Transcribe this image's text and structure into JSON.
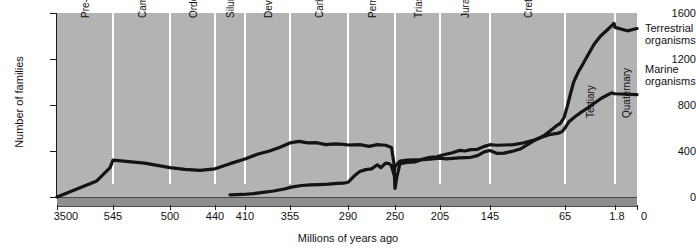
{
  "chart_data": {
    "type": "line",
    "title": "",
    "xlabel": "Millions of years ago",
    "ylabel": "Number of families",
    "ylim": [
      0,
      1600
    ],
    "yticks": [
      0,
      400,
      800,
      1200,
      1600
    ],
    "ytick_labels": [
      "0",
      "400",
      "800",
      "1200",
      "1600"
    ],
    "xtick_labels": [
      "3500",
      "545",
      "500",
      "440",
      "410",
      "355",
      "290",
      "250",
      "205",
      "145",
      "65",
      "1.8",
      "0"
    ],
    "xtick_values": [
      3500,
      545,
      500,
      440,
      410,
      355,
      290,
      250,
      205,
      145,
      65,
      1.8,
      0
    ],
    "x_axis_reversed": true,
    "grid": false,
    "legend_position": "right",
    "periods": [
      "Pre-cambrian",
      "Cambrian",
      "Ordovician",
      "Silurian",
      "Devonian",
      "Carboniferous",
      "Permian",
      "Triassic",
      "Jurassic",
      "Cretaceous",
      "Tertiary",
      "Quaternary"
    ],
    "series": [
      {
        "name": "Marine organisms",
        "legend_label_line1": "Marine",
        "legend_label_line2": "organisms",
        "color": "#141414",
        "points": [
          [
            3500,
            0
          ],
          [
            1400,
            140
          ],
          [
            700,
            255
          ],
          [
            545,
            320
          ],
          [
            520,
            295
          ],
          [
            500,
            255
          ],
          [
            480,
            240
          ],
          [
            460,
            232
          ],
          [
            440,
            245
          ],
          [
            425,
            290
          ],
          [
            410,
            330
          ],
          [
            395,
            372
          ],
          [
            380,
            400
          ],
          [
            368,
            430
          ],
          [
            355,
            470
          ],
          [
            345,
            483
          ],
          [
            335,
            470
          ],
          [
            325,
            472
          ],
          [
            315,
            455
          ],
          [
            305,
            462
          ],
          [
            295,
            458
          ],
          [
            290,
            452
          ],
          [
            280,
            455
          ],
          [
            272,
            440
          ],
          [
            265,
            455
          ],
          [
            258,
            450
          ],
          [
            253,
            430
          ],
          [
            251,
            300
          ],
          [
            250,
            75
          ],
          [
            248,
            180
          ],
          [
            245,
            290
          ],
          [
            238,
            300
          ],
          [
            230,
            305
          ],
          [
            222,
            330
          ],
          [
            215,
            345
          ],
          [
            208,
            350
          ],
          [
            205,
            358
          ],
          [
            198,
            372
          ],
          [
            190,
            385
          ],
          [
            182,
            405
          ],
          [
            175,
            400
          ],
          [
            168,
            412
          ],
          [
            160,
            415
          ],
          [
            152,
            440
          ],
          [
            145,
            455
          ],
          [
            138,
            450
          ],
          [
            130,
            452
          ],
          [
            120,
            455
          ],
          [
            110,
            470
          ],
          [
            100,
            490
          ],
          [
            90,
            520
          ],
          [
            80,
            545
          ],
          [
            72,
            555
          ],
          [
            68,
            570
          ],
          [
            65,
            600
          ],
          [
            60,
            655
          ],
          [
            52,
            700
          ],
          [
            44,
            740
          ],
          [
            36,
            775
          ],
          [
            28,
            815
          ],
          [
            20,
            855
          ],
          [
            12,
            885
          ],
          [
            6,
            905
          ],
          [
            2,
            898
          ],
          [
            0,
            890
          ]
        ]
      },
      {
        "name": "Terrestrial organisms",
        "legend_label_line1": "Terrestrial",
        "legend_label_line2": "organisms",
        "color": "#141414",
        "points": [
          [
            425,
            18
          ],
          [
            412,
            22
          ],
          [
            400,
            30
          ],
          [
            388,
            40
          ],
          [
            375,
            52
          ],
          [
            362,
            70
          ],
          [
            352,
            88
          ],
          [
            342,
            100
          ],
          [
            332,
            105
          ],
          [
            322,
            108
          ],
          [
            312,
            112
          ],
          [
            302,
            118
          ],
          [
            295,
            120
          ],
          [
            290,
            128
          ],
          [
            285,
            180
          ],
          [
            280,
            222
          ],
          [
            275,
            238
          ],
          [
            270,
            245
          ],
          [
            265,
            280
          ],
          [
            262,
            255
          ],
          [
            258,
            295
          ],
          [
            255,
            290
          ],
          [
            253,
            270
          ],
          [
            251,
            200
          ],
          [
            250,
            265
          ],
          [
            245,
            312
          ],
          [
            238,
            320
          ],
          [
            230,
            322
          ],
          [
            222,
            325
          ],
          [
            215,
            330
          ],
          [
            208,
            335
          ],
          [
            205,
            338
          ],
          [
            198,
            332
          ],
          [
            190,
            336
          ],
          [
            182,
            340
          ],
          [
            175,
            342
          ],
          [
            168,
            345
          ],
          [
            160,
            360
          ],
          [
            152,
            392
          ],
          [
            145,
            405
          ],
          [
            138,
            380
          ],
          [
            130,
            382
          ],
          [
            120,
            400
          ],
          [
            112,
            420
          ],
          [
            105,
            455
          ],
          [
            96,
            498
          ],
          [
            88,
            530
          ],
          [
            80,
            580
          ],
          [
            74,
            620
          ],
          [
            70,
            640
          ],
          [
            66,
            690
          ],
          [
            62,
            790
          ],
          [
            58,
            900
          ],
          [
            54,
            1000
          ],
          [
            48,
            1090
          ],
          [
            42,
            1160
          ],
          [
            36,
            1235
          ],
          [
            28,
            1330
          ],
          [
            20,
            1400
          ],
          [
            12,
            1450
          ],
          [
            6,
            1490
          ],
          [
            3,
            1510
          ],
          [
            1.8,
            1475
          ],
          [
            0.8,
            1445
          ],
          [
            0,
            1465
          ]
        ]
      }
    ]
  }
}
